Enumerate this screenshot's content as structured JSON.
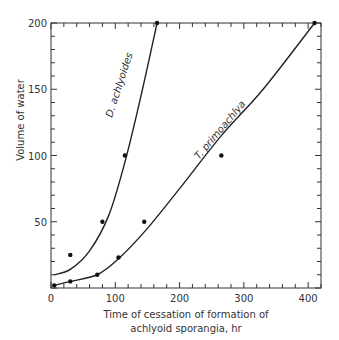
{
  "chart_data": {
    "type": "scatter",
    "title": "",
    "xlabel_line1": "Time of cessation of formation of",
    "xlabel_line2": "achlyoid sporangia, hr",
    "ylabel": "Volume of water",
    "xlim": [
      0,
      420
    ],
    "ylim": [
      0,
      200
    ],
    "x_ticks": [
      0,
      100,
      200,
      300,
      400
    ],
    "x_tick_labels": [
      "0",
      "100",
      "200",
      "300",
      "400"
    ],
    "y_ticks": [
      50,
      100,
      150,
      200
    ],
    "y_tick_labels": [
      "50",
      "100",
      "150",
      "200"
    ],
    "grid": false,
    "legend": "none (curves labeled inline)",
    "series": [
      {
        "name": "D. achlyoides",
        "points": [
          [
            30,
            25
          ],
          [
            80,
            50
          ],
          [
            115,
            100
          ],
          [
            165,
            200
          ]
        ],
        "fit_curve": [
          [
            5,
            10
          ],
          [
            30,
            14
          ],
          [
            60,
            28
          ],
          [
            90,
            55
          ],
          [
            115,
            95
          ],
          [
            140,
            145
          ],
          [
            165,
            200
          ]
        ]
      },
      {
        "name": "T. primoachlya",
        "points": [
          [
            5,
            2
          ],
          [
            30,
            5
          ],
          [
            72,
            10
          ],
          [
            105,
            23
          ],
          [
            145,
            50
          ],
          [
            265,
            100
          ],
          [
            410,
            200
          ]
        ],
        "fit_curve": [
          [
            5,
            2
          ],
          [
            30,
            5
          ],
          [
            72,
            10
          ],
          [
            105,
            22
          ],
          [
            150,
            45
          ],
          [
            200,
            75
          ],
          [
            265,
            115
          ],
          [
            330,
            150
          ],
          [
            410,
            200
          ]
        ]
      }
    ]
  }
}
